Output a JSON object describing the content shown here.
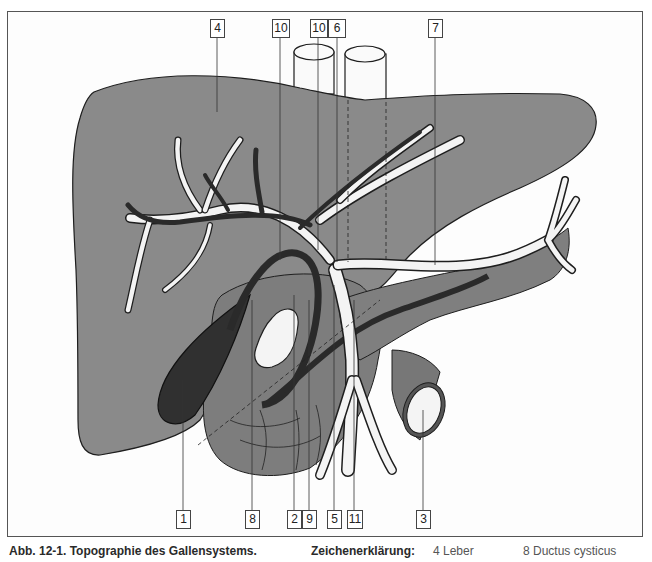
{
  "figure": {
    "caption": "Abb. 12-1. Topographie des Gallensystems.",
    "legend_title": "Zeichenerklärung:",
    "legend_items": [
      "4 Leber",
      "8 Ductus cysticus"
    ]
  },
  "labels_top": [
    "4",
    "10",
    "10",
    "6",
    "7"
  ],
  "labels_bottom": [
    "1",
    "8",
    "2",
    "9",
    "5",
    "11",
    "3"
  ],
  "colors": {
    "liver": "#8a8a8a",
    "gallbladder": "#303030",
    "duct_dark": "#2a2a2a",
    "vessel_white": "#f4f4f4",
    "outline": "#1e1e1e"
  }
}
